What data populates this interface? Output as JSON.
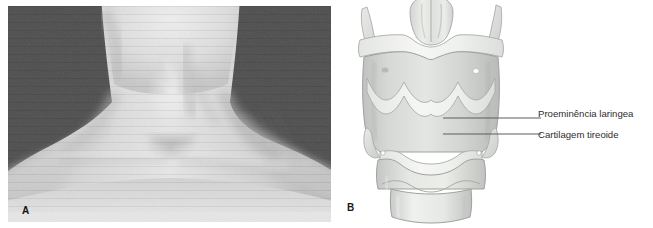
{
  "figure": {
    "panels": [
      {
        "letter": "A",
        "kind": "photograph",
        "subject": "anterior neck showing laryngeal prominence",
        "background_color": "#4c4c4c",
        "skin_color": "#d9d9d9"
      },
      {
        "letter": "B",
        "kind": "illustration",
        "subject": "larynx, anterior view",
        "background_color": "#ffffff",
        "cartilage_color": "#d5d7d4",
        "membrane_color": "#f2f2f0",
        "outline_color": "#9a9d99"
      }
    ],
    "callouts": [
      {
        "label": "Proeminência laringea",
        "leader_line_color": "#5d5d5d"
      },
      {
        "label": "Cartilagem tireoide",
        "leader_line_color": "#5d5d5d"
      }
    ]
  }
}
